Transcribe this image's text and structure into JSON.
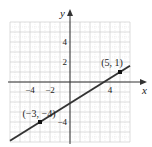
{
  "chart_data": {
    "type": "line",
    "title": "",
    "xlabel": "x",
    "ylabel": "y",
    "xlim": [
      -6,
      6
    ],
    "ylim": [
      -6,
      6
    ],
    "grid": true,
    "x_ticks": [
      {
        "value": -4,
        "label": "−4"
      },
      {
        "value": -2,
        "label": "−2"
      },
      {
        "value": 4,
        "label": "4"
      }
    ],
    "y_ticks": [
      {
        "value": 4,
        "label": "4"
      },
      {
        "value": 2,
        "label": "2"
      },
      {
        "value": -4,
        "label": "−4"
      }
    ],
    "series": [
      {
        "name": "line through (−3, −4) and (5, 1)",
        "slope": 0.625,
        "intercept": -2.125,
        "x": [
          -6,
          6
        ],
        "y": [
          -5.875,
          1.625
        ]
      }
    ],
    "points": [
      {
        "x": -3,
        "y": -4,
        "label": "(−3, −4)"
      },
      {
        "x": 5,
        "y": 1,
        "label": "(5, 1)"
      }
    ]
  }
}
